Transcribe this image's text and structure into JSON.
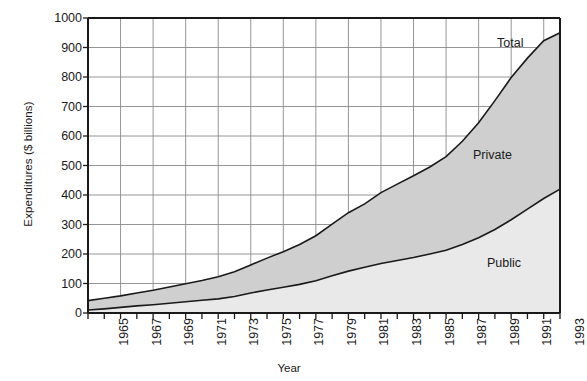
{
  "chart_data": {
    "type": "area",
    "stacked": true,
    "title": "",
    "xlabel": "Year",
    "ylabel": "Expenditures ($ billions)",
    "xlim": [
      1965,
      1994
    ],
    "ylim": [
      0,
      1000
    ],
    "ytick_step": 100,
    "yticks": [
      0,
      100,
      200,
      300,
      400,
      500,
      600,
      700,
      800,
      900,
      1000
    ],
    "ytick_labels": [
      "0",
      "100",
      "200",
      "300",
      "400",
      "500",
      "600",
      "700",
      "800",
      "900",
      "1000"
    ],
    "xticks": [
      1965,
      1966,
      1967,
      1968,
      1969,
      1970,
      1971,
      1972,
      1973,
      1974,
      1975,
      1976,
      1977,
      1978,
      1979,
      1980,
      1981,
      1982,
      1983,
      1984,
      1985,
      1986,
      1987,
      1988,
      1989,
      1990,
      1991,
      1992,
      1993,
      1994
    ],
    "xtick_labels": [
      "1965",
      "1967",
      "1969",
      "1971",
      "1973",
      "1975",
      "1977",
      "1979",
      "1981",
      "1983",
      "1985",
      "1987",
      "1989",
      "1991",
      "1993"
    ],
    "xtick_labeled_years": [
      1965,
      1967,
      1969,
      1971,
      1973,
      1975,
      1977,
      1979,
      1981,
      1983,
      1985,
      1987,
      1989,
      1991,
      1993
    ],
    "grid": true,
    "grid_x": true,
    "grid_y": true,
    "legend_position": "inline-annotations",
    "annotations": [
      {
        "name": "total",
        "label": "Total"
      },
      {
        "name": "private",
        "label": "Private"
      },
      {
        "name": "public",
        "label": "Public"
      }
    ],
    "x": [
      1965,
      1966,
      1967,
      1968,
      1969,
      1970,
      1971,
      1972,
      1973,
      1974,
      1975,
      1976,
      1977,
      1978,
      1979,
      1980,
      1981,
      1982,
      1983,
      1984,
      1985,
      1986,
      1987,
      1988,
      1989,
      1990,
      1991,
      1992,
      1993,
      1994
    ],
    "series": [
      {
        "name": "Public",
        "label": "Public",
        "color": "#e9e9e9",
        "values": [
          10,
          14,
          19,
          24,
          28,
          33,
          38,
          43,
          48,
          56,
          68,
          78,
          87,
          97,
          109,
          126,
          142,
          155,
          168,
          178,
          188,
          200,
          213,
          232,
          255,
          283,
          316,
          352,
          388,
          420
        ]
      },
      {
        "name": "Private",
        "label": "Private",
        "color": "#cfcfcf",
        "values": [
          32,
          36,
          39,
          44,
          49,
          55,
          61,
          67,
          75,
          84,
          95,
          108,
          121,
          135,
          153,
          175,
          198,
          215,
          240,
          259,
          277,
          295,
          317,
          350,
          390,
          437,
          482,
          512,
          535,
          530
        ]
      }
    ],
    "totals": {
      "name": "Total",
      "label": "Total",
      "values": [
        42,
        50,
        58,
        68,
        77,
        88,
        99,
        110,
        123,
        140,
        163,
        186,
        208,
        232,
        262,
        301,
        340,
        370,
        408,
        437,
        465,
        495,
        530,
        582,
        645,
        720,
        798,
        864,
        923,
        950
      ]
    }
  },
  "style": {
    "axis_color": "#1a1a1a",
    "grid_color": "#8a8a8a",
    "line_color": "#1a1a1a",
    "background": "#ffffff"
  }
}
